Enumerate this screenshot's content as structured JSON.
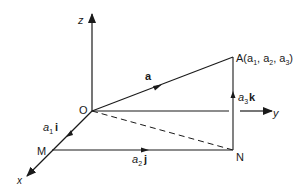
{
  "diagram": {
    "stroke_color": "#1a1a1a",
    "background": "#ffffff",
    "axes": {
      "z": {
        "label": "z"
      },
      "y": {
        "label": "y"
      },
      "x": {
        "label": "x"
      }
    },
    "points": {
      "O": {
        "label": "O"
      },
      "A": {
        "label": "A(a",
        "sub1": "1",
        "sep1": ", a",
        "sub2": "2",
        "sep2": ", a",
        "sub3": "3",
        "close": ")"
      },
      "M": {
        "label": "M"
      },
      "N": {
        "label": "N"
      }
    },
    "vectors": {
      "a": {
        "label": "a"
      },
      "a1i": {
        "coef": "a",
        "sub": "1",
        "unit": "i"
      },
      "a2j": {
        "coef": "a",
        "sub": "2",
        "unit": "j"
      },
      "a3k": {
        "coef": "a",
        "sub": "3",
        "unit": "k"
      }
    },
    "segments": [
      {
        "from": "O",
        "to": "A",
        "style": "solid",
        "arrow": "mid"
      },
      {
        "from": "O",
        "to": "M",
        "style": "solid",
        "arrow": "mid"
      },
      {
        "from": "M",
        "to": "N",
        "style": "solid",
        "arrow": "mid"
      },
      {
        "from": "N",
        "to": "A",
        "style": "solid",
        "arrow": "mid"
      },
      {
        "from": "O",
        "to": "N",
        "style": "dashed",
        "arrow": "none"
      }
    ]
  }
}
